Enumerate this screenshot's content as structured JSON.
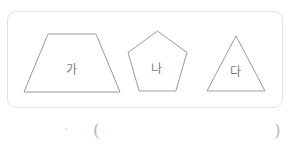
{
  "page": {
    "background_color": "#ffffff",
    "width": 290,
    "height": 148
  },
  "shape_box": {
    "border_color": "#e2e2e2",
    "radius": 9,
    "shapes": [
      {
        "id": "trapezoid",
        "name": "trapezoid",
        "label": "가",
        "points": "33,79 17,79 23,0 63,0 79,79",
        "stroke_color": "#9a9a9a",
        "fill_color": "#ffffff",
        "label_color": "#7d7d7d"
      },
      {
        "id": "pentagon",
        "name": "pentagon",
        "label": "나",
        "points": "29,0 58,21 47,56 11,56 0,21",
        "stroke_color": "#9a9a9a",
        "fill_color": "#ffffff",
        "label_color": "#7d7d7d"
      },
      {
        "id": "triangle",
        "name": "triangle",
        "label": "다",
        "points": "28,0 57,55 0,55",
        "stroke_color": "#9a9a9a",
        "fill_color": "#ffffff",
        "label_color": "#7d7d7d"
      }
    ]
  },
  "answer_line": {
    "open_paren": "(",
    "close_paren": ")",
    "color": "#b9b9b9"
  }
}
